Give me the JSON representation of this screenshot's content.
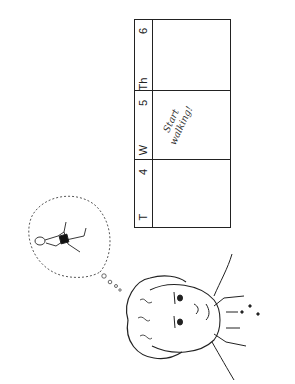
{
  "illustration": {
    "description": "Rotated line drawing: person's head daydreaming (thought bubble with a figure doing an exercise stretch) next to a weekly calendar",
    "orientation": "rotated 90 degrees counter-clockwise",
    "colors": {
      "line": "#222222",
      "background": "#ffffff",
      "shorts": "#111111"
    }
  },
  "calendar": {
    "days": [
      {
        "day_label": "T",
        "date": ""
      },
      {
        "day_label": "W",
        "date": "4"
      },
      {
        "day_label": "Th",
        "date": "5"
      },
      {
        "day_label": "",
        "date": "6"
      }
    ],
    "note": {
      "line1": "Start",
      "line2": "walking!"
    }
  },
  "thought_bubble": {
    "content": "exercising figure lying down stretching legs"
  }
}
